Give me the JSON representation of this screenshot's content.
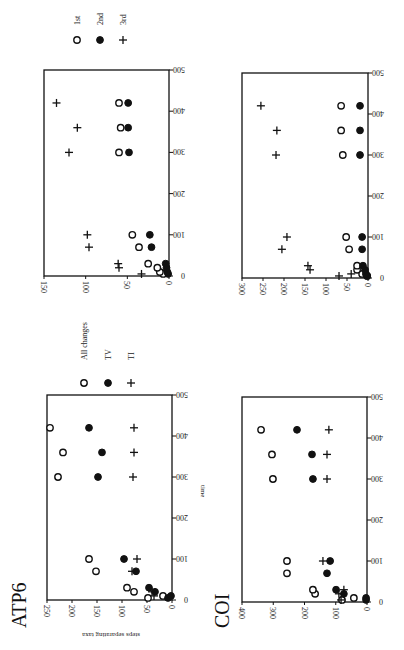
{
  "figure": {
    "axis_titles": {
      "time": "time",
      "steps": "steps separating taxa"
    }
  },
  "chart_data": [
    {
      "id": "atp6-codon",
      "type": "scatter",
      "gene": "",
      "xlabel": "time",
      "ylabel": "steps separating taxa",
      "xlim": [
        0,
        500
      ],
      "ylim": [
        0,
        150
      ],
      "x_ticks": [
        0,
        100,
        200,
        300,
        400,
        500
      ],
      "y_ticks": [
        0,
        50,
        100,
        150
      ],
      "legend": [
        {
          "label": "1st",
          "marker": "open-circle"
        },
        {
          "label": "2nd",
          "marker": "filled-circle"
        },
        {
          "label": "3rd",
          "marker": "plus"
        }
      ],
      "series": [
        {
          "name": "1st",
          "marker": "open-circle",
          "points": [
            [
              5,
              7
            ],
            [
              10,
              11
            ],
            [
              20,
              14
            ],
            [
              30,
              25
            ],
            [
              70,
              36
            ],
            [
              100,
              44
            ],
            [
              300,
              60
            ],
            [
              360,
              58
            ],
            [
              420,
              60
            ]
          ]
        },
        {
          "name": "2nd",
          "marker": "filled-circle",
          "points": [
            [
              5,
              1
            ],
            [
              10,
              2
            ],
            [
              20,
              3
            ],
            [
              30,
              4
            ],
            [
              70,
              21
            ],
            [
              100,
              23
            ],
            [
              300,
              48
            ],
            [
              360,
              49
            ],
            [
              420,
              49
            ]
          ]
        },
        {
          "name": "3rd",
          "marker": "plus",
          "points": [
            [
              5,
              33
            ],
            [
              20,
              60
            ],
            [
              30,
              61
            ],
            [
              70,
              96
            ],
            [
              100,
              98
            ],
            [
              300,
              120
            ],
            [
              360,
              110
            ],
            [
              420,
              135
            ]
          ]
        }
      ]
    },
    {
      "id": "coi-codon",
      "type": "scatter",
      "gene": "",
      "xlabel": "time",
      "ylabel": "steps separating taxa",
      "xlim": [
        0,
        500
      ],
      "ylim": [
        0,
        300
      ],
      "x_ticks": [
        0,
        100,
        200,
        300,
        400,
        500
      ],
      "y_ticks": [
        0,
        50,
        100,
        150,
        200,
        250,
        300
      ],
      "legend": [],
      "series": [
        {
          "name": "1st",
          "marker": "open-circle",
          "points": [
            [
              5,
              2
            ],
            [
              10,
              14
            ],
            [
              20,
              26
            ],
            [
              30,
              26
            ],
            [
              70,
              45
            ],
            [
              100,
              52
            ],
            [
              300,
              60
            ],
            [
              360,
              64
            ],
            [
              420,
              64
            ]
          ]
        },
        {
          "name": "2nd",
          "marker": "filled-circle",
          "points": [
            [
              5,
              2
            ],
            [
              10,
              5
            ],
            [
              20,
              7
            ],
            [
              30,
              12
            ],
            [
              70,
              14
            ],
            [
              100,
              14
            ],
            [
              300,
              19
            ],
            [
              360,
              19
            ],
            [
              420,
              19
            ]
          ]
        },
        {
          "name": "3rd",
          "marker": "plus",
          "points": [
            [
              5,
              69
            ],
            [
              10,
              40
            ],
            [
              20,
              138
            ],
            [
              30,
              143
            ],
            [
              70,
              205
            ],
            [
              100,
              193
            ],
            [
              300,
              219
            ],
            [
              360,
              217
            ],
            [
              420,
              255
            ]
          ]
        }
      ]
    },
    {
      "id": "atp6-changes",
      "type": "scatter",
      "gene": "ATP6",
      "xlabel": "time",
      "ylabel": "steps separating taxa",
      "xlim": [
        0,
        500
      ],
      "ylim": [
        0,
        250
      ],
      "x_ticks": [
        0,
        100,
        200,
        300,
        400,
        500
      ],
      "y_ticks": [
        0,
        50,
        100,
        150,
        200,
        250
      ],
      "legend": [
        {
          "label": "All changes",
          "marker": "open-circle"
        },
        {
          "label": "TV",
          "marker": "filled-circle"
        },
        {
          "label": "TI",
          "marker": "plus"
        }
      ],
      "series": [
        {
          "name": "All changes",
          "marker": "open-circle",
          "points": [
            [
              5,
              48
            ],
            [
              10,
              18
            ],
            [
              20,
              76
            ],
            [
              30,
              90
            ],
            [
              70,
              152
            ],
            [
              100,
              166
            ],
            [
              300,
              228
            ],
            [
              360,
              218
            ],
            [
              420,
              244
            ]
          ]
        },
        {
          "name": "TV",
          "marker": "filled-circle",
          "points": [
            [
              5,
              8
            ],
            [
              10,
              2
            ],
            [
              20,
              34
            ],
            [
              30,
              46
            ],
            [
              70,
              72
            ],
            [
              100,
              96
            ],
            [
              300,
              148
            ],
            [
              360,
              140
            ],
            [
              420,
              166
            ]
          ]
        },
        {
          "name": "TI",
          "marker": "plus",
          "points": [
            [
              10,
              36
            ],
            [
              20,
              40
            ],
            [
              70,
              80
            ],
            [
              100,
              70
            ],
            [
              300,
              78
            ],
            [
              360,
              76
            ],
            [
              420,
              76
            ]
          ]
        }
      ]
    },
    {
      "id": "coi-changes",
      "type": "scatter",
      "gene": "COI",
      "xlabel": "time",
      "ylabel": "steps separating taxa",
      "xlim": [
        0,
        500
      ],
      "ylim": [
        0,
        400
      ],
      "x_ticks": [
        0,
        100,
        200,
        300,
        400,
        500
      ],
      "y_ticks": [
        0,
        100,
        200,
        300,
        400
      ],
      "legend": [],
      "series": [
        {
          "name": "All changes",
          "marker": "open-circle",
          "points": [
            [
              5,
              80
            ],
            [
              10,
              42
            ],
            [
              20,
              166
            ],
            [
              30,
              173
            ],
            [
              70,
              256
            ],
            [
              100,
              256
            ],
            [
              300,
              301
            ],
            [
              360,
              304
            ],
            [
              420,
              339
            ]
          ]
        },
        {
          "name": "TV",
          "marker": "filled-circle",
          "points": [
            [
              5,
              3
            ],
            [
              10,
              3
            ],
            [
              20,
              74
            ],
            [
              30,
              99
            ],
            [
              70,
              128
            ],
            [
              100,
              118
            ],
            [
              300,
              173
            ],
            [
              360,
              176
            ],
            [
              420,
              224
            ]
          ]
        },
        {
          "name": "TI",
          "marker": "plus",
          "points": [
            [
              5,
              83
            ],
            [
              20,
              90
            ],
            [
              30,
              74
            ],
            [
              100,
              141
            ],
            [
              300,
              128
            ],
            [
              360,
              128
            ],
            [
              420,
              122
            ]
          ]
        }
      ]
    }
  ]
}
